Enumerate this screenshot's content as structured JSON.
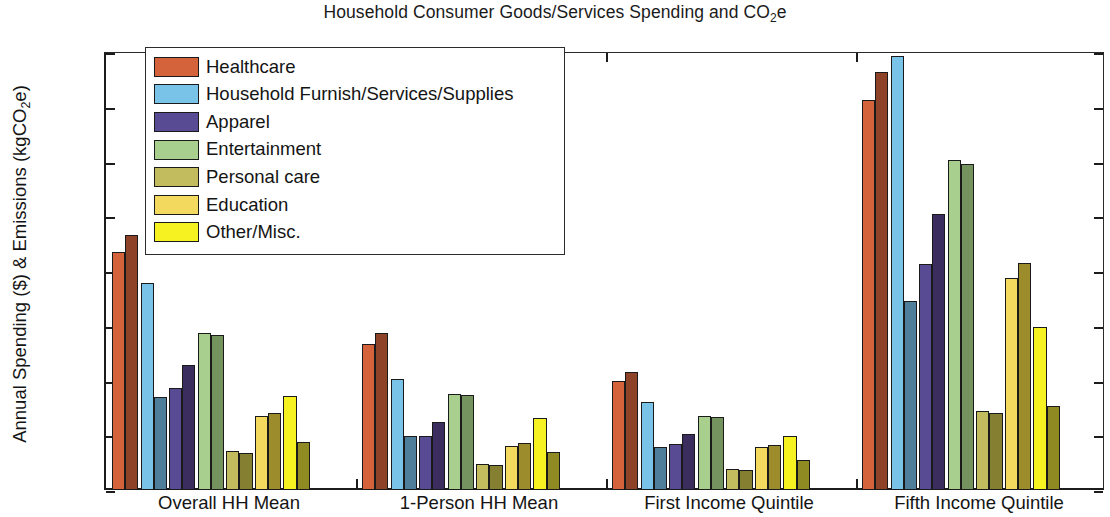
{
  "chart_data": {
    "type": "bar",
    "title": "Household Consumer Goods/Services Spending and CO2e",
    "title_prefix": "Household Consumer Goods/Services Spending and CO",
    "title_sub": "2",
    "title_suffix": "e",
    "xlabel": "",
    "ylabel": "Annual Spending ($) & Emissions (kgCO2e)",
    "ylabel_prefix": "Annual Spending ($) & Emissions (kgCO",
    "ylabel_sub": "2",
    "ylabel_suffix": "e)",
    "ylim": [
      0,
      8000
    ],
    "ytick_labels": [
      "0",
      "1000",
      "2000",
      "3000",
      "4000",
      "5000",
      "6000",
      "7000",
      "8000"
    ],
    "ytick_values": [
      0,
      1000,
      2000,
      3000,
      4000,
      5000,
      6000,
      7000,
      8000
    ],
    "grid": false,
    "legend_position": "upper-left-inside",
    "categories": [
      "Overall HH Mean",
      "1-Person HH Mean",
      "First Income Quintile",
      "Fifth Income Quintile"
    ],
    "legend_entries": [
      "Healthcare",
      "Household Furnish/Services/Supplies",
      "Apparel",
      "Entertainment",
      "Personal care",
      "Education",
      "Other/Misc."
    ],
    "colors": {
      "healthcare": "#D4633C",
      "healthcare_dark": "#8E4228",
      "household_furnish": "#79C2E8",
      "household_furnish_dark": "#4E7E99",
      "apparel": "#584B93",
      "apparel_dark": "#3B2E5E",
      "entertainment": "#A9CF8E",
      "entertainment_dark": "#74935F",
      "personal_care": "#C2BC5E",
      "personal_care_dark": "#857F31",
      "education": "#F4D95F",
      "education_dark": "#9D8C2C",
      "other_misc": "#F6F222",
      "other_misc_dark": "#8F8B22",
      "axis": "#1c1c1c",
      "background": "#ffffff"
    },
    "series": [
      {
        "name": "Healthcare",
        "color_key": "healthcare",
        "spending": [
          4340,
          2670,
          2000,
          7130
        ],
        "emissions": [
          4650,
          2870,
          2150,
          7640
        ]
      },
      {
        "name": "Household Furnish/Services/Supplies",
        "color_key": "household_furnish",
        "spending": [
          3790,
          2020,
          1610,
          7920
        ],
        "emissions": [
          1700,
          990,
          780,
          3450
        ]
      },
      {
        "name": "Apparel",
        "color_key": "apparel",
        "spending": [
          1870,
          990,
          840,
          4120
        ],
        "emissions": [
          2280,
          1240,
          1030,
          5050
        ]
      },
      {
        "name": "Entertainment",
        "color_key": "entertainment",
        "spending": [
          2860,
          1760,
          1350,
          6020
        ],
        "emissions": [
          2830,
          1740,
          1330,
          5960
        ]
      },
      {
        "name": "Personal care",
        "color_key": "personal_care",
        "spending": [
          720,
          470,
          390,
          1440
        ],
        "emissions": [
          680,
          450,
          370,
          1400
        ]
      },
      {
        "name": "Education",
        "color_key": "education",
        "spending": [
          1350,
          800,
          790,
          3880
        ],
        "emissions": [
          1400,
          850,
          830,
          4150
        ]
      },
      {
        "name": "Other/Misc.",
        "color_key": "other_misc",
        "spending": [
          1710,
          1310,
          980,
          2980
        ],
        "emissions": [
          870,
          690,
          540,
          1540
        ]
      }
    ]
  }
}
